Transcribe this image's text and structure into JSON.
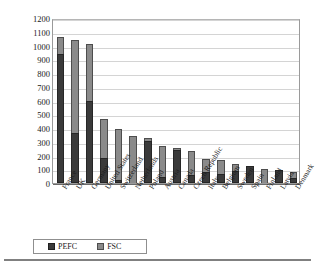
{
  "chart_data": {
    "type": "bar",
    "subtype": "stacked-vertical-bar",
    "title": "",
    "xlabel": "",
    "ylabel": "Number of Certificates",
    "ylim": [
      0,
      1200
    ],
    "ytick_step": 100,
    "ytick_labels": [
      "1200",
      "1100",
      "1000",
      "900",
      "800",
      "700",
      "600",
      "500",
      "400",
      "300",
      "200",
      "100",
      "0"
    ],
    "ytick_values": [
      1200,
      1100,
      1000,
      900,
      800,
      700,
      600,
      500,
      400,
      300,
      200,
      100,
      0
    ],
    "grid": true,
    "grid_axis": "y",
    "legend_position": "bottom-left",
    "categories": [
      "France",
      "UK",
      "Germany",
      "United States",
      "Switzerland",
      "Netherlands",
      "Poland",
      "Austria",
      "Canada",
      "Czech Republic",
      "Italy",
      "Belgium",
      "Sweden",
      "Spain",
      "Finland",
      "Latvia",
      "Denmark"
    ],
    "series": [
      {
        "name": "PEFC",
        "color": "#3a3a3a",
        "values": [
          940,
          365,
          595,
          185,
          25,
          0,
          305,
          45,
          240,
          55,
          80,
          65,
          85,
          125,
          0,
          95,
          35
        ]
      },
      {
        "name": "FSC",
        "color": "#8a8a8a",
        "values": [
          120,
          675,
          415,
          280,
          370,
          340,
          20,
          225,
          15,
          180,
          95,
          105,
          50,
          0,
          100,
          0,
          45
        ]
      }
    ],
    "totals": [
      1060,
      1040,
      1010,
      465,
      395,
      340,
      325,
      270,
      255,
      235,
      175,
      170,
      135,
      125,
      100,
      95,
      80
    ]
  },
  "axis": {
    "y_title": "Number of Certificates"
  },
  "legend": {
    "items": [
      {
        "label": "PEFC",
        "color": "#3a3a3a"
      },
      {
        "label": "FSC",
        "color": "#8a8a8a"
      }
    ]
  },
  "colors": {
    "pefc": "#3a3a3a",
    "fsc": "#8a8a8a",
    "gridline": "#d4d4d4",
    "axis": "#6a6a6a",
    "background": "#ffffff"
  }
}
